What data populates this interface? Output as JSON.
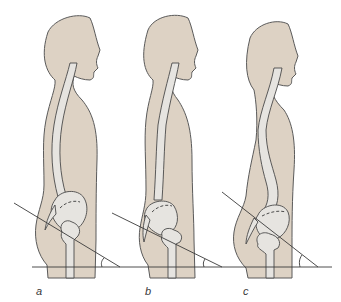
{
  "figure": {
    "colors": {
      "skin": "#ddd2c4",
      "bone": "#e6e4e0",
      "outline": "#555555",
      "line": "#333333",
      "background": "#ffffff"
    },
    "panels": [
      {
        "label": "a"
      },
      {
        "label": "b"
      },
      {
        "label": "c"
      }
    ]
  }
}
